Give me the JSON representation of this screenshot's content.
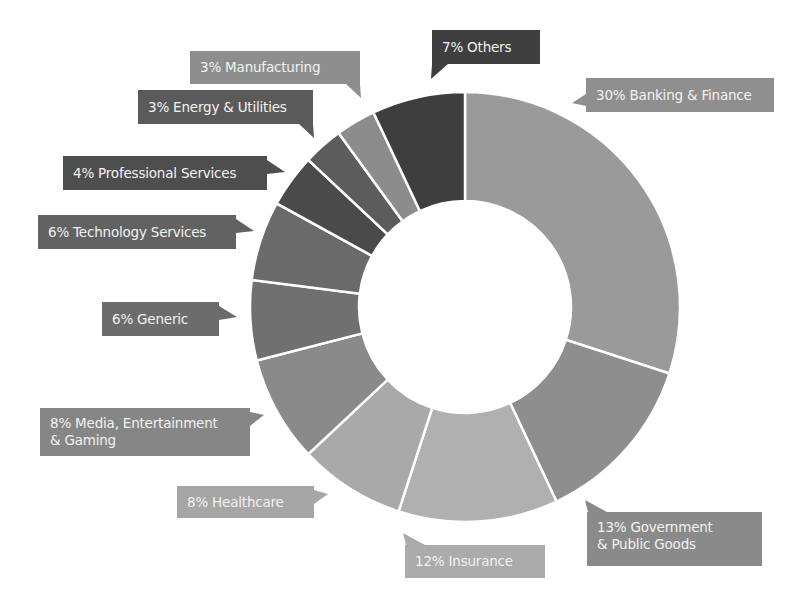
{
  "chart_data": {
    "type": "pie",
    "subtype": "donut",
    "title": "",
    "start_angle_deg": 0,
    "direction": "clockwise",
    "categories": [
      "Banking & Finance",
      "Government & Public Goods",
      "Insurance",
      "Healthcare",
      "Media, Entertainment & Gaming",
      "Generic",
      "Technology Services",
      "Professional Services",
      "Energy & Utilities",
      "Manufacturing",
      "Others"
    ],
    "values": [
      30,
      13,
      12,
      8,
      8,
      6,
      6,
      4,
      3,
      3,
      7
    ],
    "unit": "%",
    "colors": [
      "#9a9a9a",
      "#8e8e8e",
      "#b0b0b0",
      "#a9a9a9",
      "#8a8a8a",
      "#707070",
      "#6a6a6a",
      "#4a4a4a",
      "#5c5c5c",
      "#8c8c8c",
      "#3e3e3e"
    ],
    "legend": "none (callout labels)",
    "labels": [
      {
        "text": "30% Banking & Finance",
        "x": 586,
        "y": 78,
        "w": 188,
        "h": 34,
        "bg": "#8f8f8f",
        "tail": "left",
        "tx": 572,
        "ty": 103
      },
      {
        "text": "13% Government\n& Public Goods",
        "x": 587,
        "y": 512,
        "w": 175,
        "h": 54,
        "bg": "#8a8a8a",
        "tail": "topleft",
        "tx": 585,
        "ty": 500
      },
      {
        "text": "12% Insurance",
        "x": 405,
        "y": 545,
        "w": 140,
        "h": 33,
        "bg": "#ababab",
        "tail": "topleft",
        "tx": 403,
        "ty": 533
      },
      {
        "text": "8% Healthcare",
        "x": 177,
        "y": 486,
        "w": 137,
        "h": 32,
        "bg": "#a6a6a6",
        "tail": "right",
        "tx": 328,
        "ty": 494
      },
      {
        "text": "8% Media, Entertainment\n& Gaming",
        "x": 40,
        "y": 408,
        "w": 210,
        "h": 48,
        "bg": "#868686",
        "tail": "right",
        "tx": 264,
        "ty": 415
      },
      {
        "text": "6% Generic",
        "x": 102,
        "y": 302,
        "w": 117,
        "h": 34,
        "bg": "#6c6c6c",
        "tail": "right",
        "tx": 237,
        "ty": 317
      },
      {
        "text": "6% Technology Services",
        "x": 38,
        "y": 215,
        "w": 198,
        "h": 34,
        "bg": "#626262",
        "tail": "right",
        "tx": 254,
        "ty": 231
      },
      {
        "text": "4% Professional Services",
        "x": 63,
        "y": 156,
        "w": 204,
        "h": 34,
        "bg": "#4e4e4e",
        "tail": "right",
        "tx": 285,
        "ty": 172
      },
      {
        "text": "3% Energy & Utilities",
        "x": 138,
        "y": 90,
        "w": 175,
        "h": 34,
        "bg": "#5a5a5a",
        "tail": "bottomright",
        "tx": 314,
        "ty": 138
      },
      {
        "text": "3% Manufacturing",
        "x": 190,
        "y": 51,
        "w": 170,
        "h": 33,
        "bg": "#8e8e8e",
        "tail": "bottomright",
        "tx": 361,
        "ty": 98
      },
      {
        "text": "7% Others",
        "x": 432,
        "y": 30,
        "w": 108,
        "h": 34,
        "bg": "#3f3f3f",
        "tail": "bottomleft",
        "tx": 431,
        "ty": 79
      }
    ],
    "geometry": {
      "cx": 465,
      "cy": 307,
      "outer_r": 215,
      "inner_r": 106,
      "separator_color": "#ffffff",
      "separator_width": 2.5
    }
  }
}
